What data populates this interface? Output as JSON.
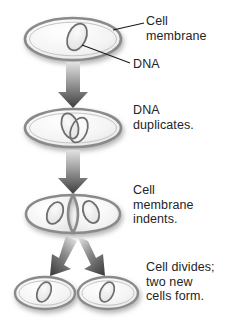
{
  "diagram": {
    "colors": {
      "background": "#ffffff",
      "text": "#242424",
      "membrane_stroke": "#8a8a8a",
      "membrane_fill": "#f2f2f2",
      "dna_stroke": "#6e6e6e",
      "dna_fill": "#e6e6e6",
      "arrow_dark": "#3d3d3d",
      "arrow_light": "#d8d8d8",
      "leader_line": "#1a1a1a",
      "shadow": "#c9c9c9"
    },
    "labels": {
      "cell_membrane": "Cell\nmembrane",
      "dna": "DNA",
      "dna_duplicates": "DNA\nduplicates.",
      "membrane_indents": "Cell\nmembrane\nindents.",
      "cell_divides": "Cell divides;\ntwo new\ncells form."
    },
    "stages": [
      {
        "id": "stage-1",
        "name": "parent-cell",
        "caption": "Cell\nmembrane",
        "dna_count": 1
      },
      {
        "id": "stage-2",
        "name": "dna-duplicated-cell",
        "caption": "DNA\nduplicates.",
        "dna_count": 2
      },
      {
        "id": "stage-3",
        "name": "indenting-cell",
        "caption": "Cell\nmembrane\nindents.",
        "dna_count": 2
      },
      {
        "id": "stage-4",
        "name": "daughter-cells",
        "caption": "Cell divides;\ntwo new\ncells form.",
        "dna_count": 2
      }
    ],
    "arrows": [
      {
        "name": "arrow-stage1-to-stage2",
        "direction": "down"
      },
      {
        "name": "arrow-stage2-to-stage3",
        "direction": "down"
      },
      {
        "name": "arrow-stage3-to-daughter-left",
        "direction": "down-left"
      },
      {
        "name": "arrow-stage3-to-daughter-right",
        "direction": "down-right"
      }
    ],
    "leaders": [
      {
        "name": "leader-cell-membrane",
        "from": "cell-membrane-label",
        "to": "parent-cell-membrane-edge"
      },
      {
        "name": "leader-dna",
        "from": "dna-label",
        "to": "parent-cell-dna"
      }
    ]
  }
}
